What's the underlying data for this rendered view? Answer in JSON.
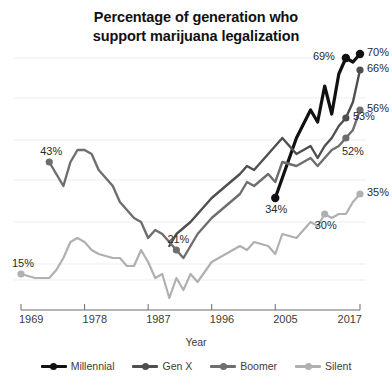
{
  "chart_data": {
    "type": "line",
    "title": "Percentage of generation who support marijuana legalization",
    "title_lines": [
      "Percentage of generation who",
      "support marijuana legalization"
    ],
    "xlabel": "Year",
    "ylabel": "",
    "xlim": [
      1969,
      2017
    ],
    "ylim": [
      5,
      75
    ],
    "xticks": [
      "1969",
      "1978",
      "1987",
      "1996",
      "2005",
      "2017"
    ],
    "xtick_values": [
      1969,
      1978,
      1987,
      1996,
      2005,
      2017
    ],
    "grid": "horizontal",
    "gridline_values": [
      69,
      59,
      48.5,
      38.5,
      28,
      17.5,
      13.5
    ],
    "legend_position": "bottom",
    "colors": {
      "millennial": "#111111",
      "genx": "#4f4f4f",
      "boomer": "#6e6e6e",
      "silent": "#b0b0b0",
      "grid": "#ededed",
      "axis": "#6b6b6b"
    },
    "series": [
      {
        "name": "Millennial",
        "color": "#111111",
        "x": [
          2005,
          2006,
          2008,
          2010,
          2011,
          2012,
          2013,
          2014,
          2015,
          2016,
          2017
        ],
        "values": [
          34,
          39,
          49,
          56,
          53,
          62,
          55,
          65,
          69,
          68,
          70
        ],
        "endpoint_labels": [
          {
            "x": 2005,
            "value": 34,
            "text": "34%",
            "pos": "below"
          },
          {
            "x": 2015,
            "value": 69,
            "text": "69%",
            "pos": "left"
          },
          {
            "x": 2017,
            "value": 70,
            "text": "70%",
            "pos": "right"
          }
        ]
      },
      {
        "name": "Gen X",
        "color": "#4f4f4f",
        "x": [
          1990,
          1991,
          1993,
          1994,
          1996,
          1998,
          2000,
          2001,
          2002,
          2004,
          2005,
          2006,
          2008,
          2010,
          2011,
          2012,
          2013,
          2014,
          2015,
          2016,
          2017
        ],
        "values": [
          22,
          25,
          28,
          30,
          34,
          37,
          40,
          42,
          41,
          45,
          47,
          49,
          45,
          47,
          44,
          47,
          49,
          52,
          54,
          58,
          66
        ],
        "endpoint_labels": [
          {
            "x": 2017,
            "value": 66,
            "text": "66%",
            "pos": "right"
          },
          {
            "x": 2015,
            "value": 54,
            "text": "53%",
            "pos": "right"
          }
        ]
      },
      {
        "name": "Boomer",
        "color": "#6e6e6e",
        "x": [
          1973,
          1974,
          1975,
          1976,
          1977,
          1978,
          1979,
          1980,
          1982,
          1983,
          1984,
          1985,
          1986,
          1987,
          1988,
          1989,
          1990,
          1991,
          1992,
          1993,
          1994,
          1996,
          1998,
          2000,
          2001,
          2002,
          2004,
          2005,
          2006,
          2008,
          2010,
          2011,
          2012,
          2013,
          2014,
          2015,
          2016,
          2017
        ],
        "values": [
          43,
          40,
          37,
          43,
          46,
          46,
          45,
          41,
          37,
          33,
          31,
          29,
          28,
          24,
          26,
          25,
          23,
          21,
          19,
          22,
          25,
          29,
          32,
          35,
          38,
          37,
          40,
          38,
          43,
          42,
          44,
          42,
          44,
          46,
          47,
          49,
          51,
          56
        ],
        "endpoint_labels": [
          {
            "x": 1973,
            "value": 43,
            "text": "43%",
            "pos": "above"
          },
          {
            "x": 1991,
            "value": 21,
            "text": "21%",
            "pos": "above"
          },
          {
            "x": 2017,
            "value": 56,
            "text": "56%",
            "pos": "right"
          },
          {
            "x": 2015,
            "value": 49,
            "text": "52%",
            "pos": "belowright"
          }
        ]
      },
      {
        "name": "Silent",
        "color": "#b0b0b0",
        "x": [
          1969,
          1971,
          1973,
          1974,
          1975,
          1976,
          1977,
          1978,
          1979,
          1980,
          1982,
          1983,
          1984,
          1985,
          1986,
          1987,
          1988,
          1989,
          1990,
          1991,
          1992,
          1993,
          1994,
          1996,
          1998,
          2000,
          2001,
          2002,
          2004,
          2005,
          2006,
          2008,
          2010,
          2011,
          2012,
          2013,
          2014,
          2015,
          2016,
          2017
        ],
        "values": [
          15,
          14,
          14,
          16,
          19,
          23,
          24,
          23,
          21,
          20,
          19,
          19,
          17,
          17,
          21,
          18,
          14,
          15,
          9,
          14,
          11,
          15,
          13,
          18,
          20,
          22,
          21,
          23,
          22,
          20,
          25,
          24,
          28,
          27,
          30,
          29,
          30,
          30,
          33,
          35
        ],
        "endpoint_labels": [
          {
            "x": 1969,
            "value": 15,
            "text": "15%",
            "pos": "above"
          },
          {
            "x": 2012,
            "value": 30,
            "text": "30%",
            "pos": "below"
          },
          {
            "x": 2017,
            "value": 35,
            "text": "35%",
            "pos": "right"
          }
        ]
      }
    ]
  },
  "legend": {
    "items": [
      {
        "label": "Millennial",
        "color": "#111111"
      },
      {
        "label": "Gen X",
        "color": "#4f4f4f"
      },
      {
        "label": "Boomer",
        "color": "#6e6e6e"
      },
      {
        "label": "Silent",
        "color": "#b0b0b0"
      }
    ]
  }
}
